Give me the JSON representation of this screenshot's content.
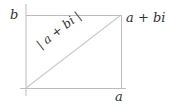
{
  "diagram": {
    "type": "complex-plane-rectangle",
    "labels": {
      "imag_axis": "b",
      "point": "a + bi",
      "real_axis": "a",
      "modulus": "| a + bi |"
    },
    "colors": {
      "lines": "#bbbbbb",
      "diagonal": "#cccccc",
      "text": "#333333"
    }
  }
}
